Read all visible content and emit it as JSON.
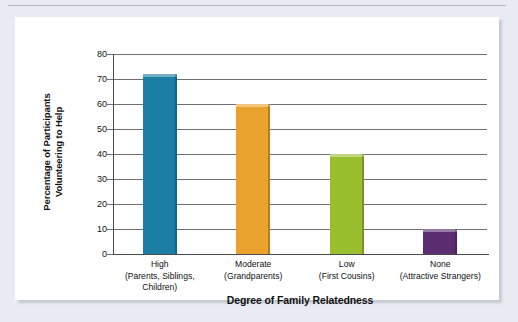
{
  "chart_data": {
    "type": "bar",
    "title": "",
    "xlabel": "Degree of Family Relatedness",
    "ylabel": "Percentage of Participants Volunteering to Help",
    "ylabel_lines": [
      "Percentage of Participants",
      "Volunteering to Help"
    ],
    "categories": [
      "High",
      "Moderate",
      "Low",
      "None"
    ],
    "category_sublabels": [
      "(Parents, Siblings, Children)",
      "(Grandparents)",
      "(First Cousins)",
      "(Attractive Strangers)"
    ],
    "values": [
      72,
      60,
      40,
      10
    ],
    "ylim": [
      0,
      80
    ],
    "ytick_labels": [
      "80",
      "70",
      "60",
      "50",
      "40",
      "30",
      "20",
      "10",
      "0"
    ],
    "ytick_values": [
      80,
      70,
      60,
      50,
      40,
      30,
      20,
      10,
      0
    ],
    "grid": true,
    "legend": "none",
    "bar_colors": [
      "#1b7ea6",
      "#e9a22c",
      "#9abf2e",
      "#5b2d70"
    ],
    "colors": {
      "gridline": "#6e7076",
      "axis": "#4a4c51",
      "panel_background": "#ffffff",
      "figure_background": "#e8ebf1",
      "text": "#111111"
    }
  }
}
